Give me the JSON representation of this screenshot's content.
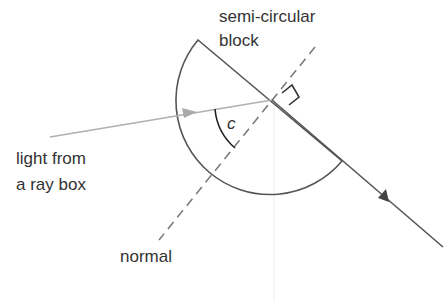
{
  "labels": {
    "block_line1": "semi-circular",
    "block_line2": "block",
    "source_line1": "light from",
    "source_line2": "a ray box",
    "normal": "normal",
    "angle": "c"
  },
  "colors": {
    "block_outline": "#555555",
    "incident_ray": "#b0b0b0",
    "reflected_ray": "#555555",
    "normal_line": "#777777",
    "text": "#333333"
  }
}
